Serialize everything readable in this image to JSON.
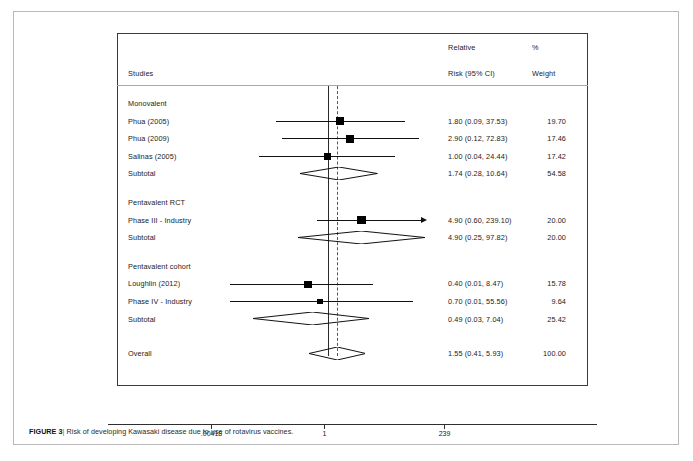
{
  "figure": {
    "label": "FIGURE 3",
    "separator": "|",
    "caption": "Risk of developing Kawasaki disease due to use of rotavirus vaccines."
  },
  "header": {
    "studies": "Studies",
    "relative_line1": "Relative",
    "relative_line2": "Risk (95% CI)",
    "percent": "%",
    "weight": "Weight"
  },
  "axis": {
    "ticks": [
      {
        "label": ".00418",
        "value": 0.00418,
        "x": 94
      },
      {
        "label": "1",
        "value": 1,
        "x": 207
      },
      {
        "label": "239",
        "value": 239,
        "x": 327
      }
    ]
  },
  "chart_data": {
    "type": "forest",
    "title": "Risk of developing Kawasaki disease due to use of rotavirus vaccines.",
    "xlabel": "",
    "ylabel": "",
    "xscale": "log",
    "xlim": [
      0.00418,
      239
    ],
    "null_value": 1,
    "overall_value": 1.55,
    "grid": false,
    "columns": [
      "Studies",
      "Relative Risk (95% CI)",
      "% Weight"
    ],
    "groups": [
      {
        "name": "Monovalent",
        "rows": [
          {
            "label": "Phua (2005)",
            "estimate": 1.8,
            "lower": 0.09,
            "upper": 37.53,
            "text": "1.80 (0.09, 37.53)",
            "weight": 19.7,
            "weight_text": "19.70",
            "kind": "study"
          },
          {
            "label": "Phua (2009)",
            "estimate": 2.9,
            "lower": 0.12,
            "upper": 72.83,
            "text": "2.90 (0.12, 72.83)",
            "weight": 17.46,
            "weight_text": "17.46",
            "kind": "study"
          },
          {
            "label": "Salinas (2005)",
            "estimate": 1.0,
            "lower": 0.04,
            "upper": 24.44,
            "text": "1.00 (0.04, 24.44)",
            "weight": 17.42,
            "weight_text": "17.42",
            "kind": "study"
          },
          {
            "label": "Subtotal",
            "estimate": 1.74,
            "lower": 0.28,
            "upper": 10.64,
            "text": "1.74 (0.28, 10.64)",
            "weight": 54.58,
            "weight_text": "54.58",
            "kind": "subtotal"
          }
        ]
      },
      {
        "name": "Pentavalent RCT",
        "rows": [
          {
            "label": "Phase III - Industry",
            "estimate": 4.9,
            "lower": 0.6,
            "upper": 239.1,
            "text": "4.90 (0.60, 239.10)",
            "weight": 20.0,
            "weight_text": "20.00",
            "kind": "study",
            "arrow_right": true
          },
          {
            "label": "Subtotal",
            "estimate": 4.9,
            "lower": 0.25,
            "upper": 97.82,
            "text": "4.90 (0.25, 97.82)",
            "weight": 20.0,
            "weight_text": "20.00",
            "kind": "subtotal"
          }
        ]
      },
      {
        "name": "Pentavalent cohort",
        "rows": [
          {
            "label": "Loughlin (2012)",
            "estimate": 0.4,
            "lower": 0.01,
            "upper": 8.47,
            "text": "0.40 (0.01, 8.47)",
            "weight": 15.78,
            "weight_text": "15.78",
            "kind": "study"
          },
          {
            "label": "Phase IV - Industry",
            "estimate": 0.7,
            "lower": 0.01,
            "upper": 55.56,
            "text": "0.70 (0.01, 55.56)",
            "weight": 9.64,
            "weight_text": "9.64",
            "kind": "study"
          },
          {
            "label": "Subtotal",
            "estimate": 0.49,
            "lower": 0.03,
            "upper": 7.04,
            "text": "0.49 (0.03, 7.04)",
            "weight": 25.42,
            "weight_text": "25.42",
            "kind": "subtotal"
          }
        ]
      },
      {
        "name": "",
        "rows": [
          {
            "label": "Overall",
            "estimate": 1.55,
            "lower": 0.41,
            "upper": 5.93,
            "text": "1.55 (0.41, 5.93)",
            "weight": 100.0,
            "weight_text": "100.00",
            "kind": "overall"
          }
        ]
      }
    ]
  }
}
